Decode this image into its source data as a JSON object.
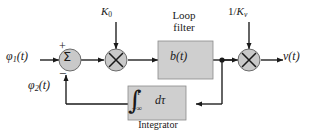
{
  "diagram": {
    "colors": {
      "line": "#1a1a1a",
      "block_fill": "#cfcfcf",
      "block_stroke": "#6b6b6b",
      "node_fill": "#c9c9c9",
      "background": "#ffffff"
    },
    "input": {
      "symbol": "φ",
      "subscript": "1",
      "arg": "(t)",
      "full_label": "φ1(t)"
    },
    "feedback": {
      "symbol": "φ",
      "subscript": "2",
      "arg": "(t)",
      "full_label": "φ2(t)"
    },
    "summing_junction": {
      "glyph": "Σ",
      "plus_sign": "+",
      "minus_sign": "−"
    },
    "gain_top_left": {
      "symbol": "K",
      "subscript": "0",
      "full_label": "K0"
    },
    "gain_top_right": {
      "numerator": "1/",
      "symbol": "K",
      "subscript": "v",
      "full_label": "1/Kv"
    },
    "loop_filter": {
      "caption_line1": "Loop",
      "caption_line2": "filter",
      "block_label_symbol": "b",
      "block_label_arg": "(t)",
      "block_label": "b(t)"
    },
    "integrator": {
      "caption": "Integrator",
      "integral_sign": "∫",
      "upper_limit": "t",
      "lower_limit": "−∞",
      "differential": "dτ"
    },
    "output": {
      "symbol": "v",
      "arg": "(t)",
      "full_label": "v(t)"
    },
    "multiplier_glyph": "×"
  }
}
